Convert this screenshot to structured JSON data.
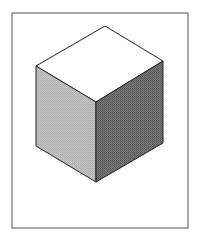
{
  "figure": {
    "frame": {
      "x": 12,
      "y": 13,
      "width": 176,
      "height": 215,
      "stroke": "#555555"
    },
    "cube": {
      "vertices": {
        "top": [
          105,
          26
        ],
        "left": [
          36,
          66
        ],
        "right": [
          163,
          61
        ],
        "center": [
          96,
          102
        ],
        "bottom_left": [
          36,
          146
        ],
        "bottom_right": [
          163,
          143
        ],
        "bottom": [
          96,
          182
        ]
      },
      "faces": {
        "top": {
          "fill": "#ffffff",
          "label": "top face"
        },
        "left": {
          "fill": "#bdbdbd",
          "dither_light": "#d6d6d6",
          "dither_dark": "#a0a0a0",
          "label": "left face"
        },
        "right": {
          "fill": "#6e6e6e",
          "dither_light": "#8a8a8a",
          "dither_dark": "#4e4e4e",
          "label": "right face"
        }
      },
      "edge_color": "#222222"
    }
  }
}
